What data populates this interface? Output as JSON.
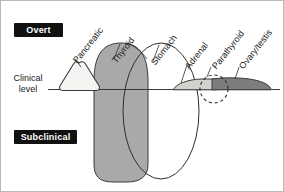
{
  "figure": {
    "width": 284,
    "height": 192
  },
  "zones": {
    "overt_label": "Overt",
    "subclinical_label": "Subclinical",
    "badge_background": "#111111",
    "badge_text_color": "#ffffff"
  },
  "axis": {
    "clinical_line_label_line1": "Clinical",
    "clinical_line_label_line2": "level",
    "line_color": "#3a3a3a",
    "line_y": 88
  },
  "organs": [
    {
      "id": "pancreatic",
      "label": "Pancreatic",
      "shape": "rounded-triangle",
      "fill": "#f2f2f0",
      "stroke": "#3a3a3a",
      "label_x": 74,
      "label_y": 56
    },
    {
      "id": "thyroid",
      "label": "Thyroid",
      "shape": "rounded-tall-oval",
      "fill": "#a9a9a9",
      "stroke": "#3a3a3a",
      "label_x": 113,
      "label_y": 56
    },
    {
      "id": "stomach",
      "label": "Stomach",
      "shape": "ellipse",
      "fill": "none",
      "stroke": "#2e2e2e",
      "label_x": 152,
      "label_y": 58
    },
    {
      "id": "adrenal",
      "label": "Adrenal",
      "shape": "lens-flat",
      "fill": "#cfcfcc",
      "stroke": "#3a3a3a",
      "label_x": 186,
      "label_y": 62
    },
    {
      "id": "parathyroid",
      "label": "Parathyroid",
      "shape": "dashed-circle",
      "fill": "none",
      "stroke": "#2e2e2e",
      "label_x": 213,
      "label_y": 62
    },
    {
      "id": "ovary-testis",
      "label": "Ovary/testis",
      "shape": "lens-flat",
      "fill": "#7d7d7d",
      "stroke": "#3a3a3a",
      "label_x": 240,
      "label_y": 62
    }
  ]
}
